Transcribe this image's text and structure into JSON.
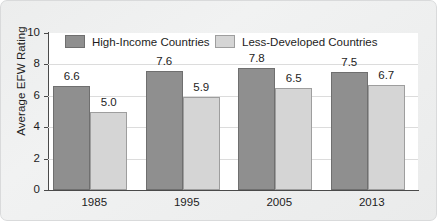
{
  "chart_data": {
    "type": "bar",
    "title": "",
    "xlabel": "",
    "ylabel": "Average EFW Rating",
    "categories": [
      "1985",
      "1995",
      "2005",
      "2013"
    ],
    "series": [
      {
        "name": "High-Income Countries",
        "color": "#8f8f8f",
        "values": [
          6.6,
          7.6,
          7.8,
          7.5
        ]
      },
      {
        "name": "Less-Developed Countries",
        "color": "#d5d5d5",
        "values": [
          5.0,
          5.9,
          6.5,
          6.7
        ]
      }
    ],
    "ylim": [
      0,
      10
    ],
    "yticks": [
      "0",
      "2",
      "4",
      "6",
      "8",
      "10"
    ],
    "ytick_values": [
      0,
      2,
      4,
      6,
      8,
      10
    ],
    "gridlines": [
      2,
      4,
      6,
      8
    ],
    "grid": true,
    "legend_position": "top-inside",
    "value_labels": [
      [
        "6.6",
        "5.0"
      ],
      [
        "7.6",
        "5.9"
      ],
      [
        "7.8",
        "6.5"
      ],
      [
        "7.5",
        "6.7"
      ]
    ]
  }
}
